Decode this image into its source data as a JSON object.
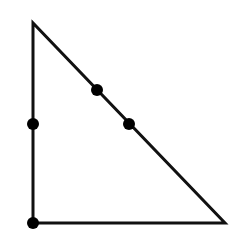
{
  "diagram": {
    "type": "right-triangle-with-points",
    "width": 229,
    "height": 246,
    "stroke_color": "#111111",
    "fill_color": "#ffffff",
    "point_color": "#000000",
    "stroke_width": 3,
    "point_radius": 6,
    "vertices": {
      "top": {
        "x": 33,
        "y": 23
      },
      "bottom_left": {
        "x": 33,
        "y": 223
      },
      "bottom_right": {
        "x": 225,
        "y": 223
      }
    },
    "points": [
      {
        "id": "left-side-midpoint",
        "x": 33,
        "y": 124
      },
      {
        "id": "hypotenuse-upper-point",
        "x": 97,
        "y": 90
      },
      {
        "id": "hypotenuse-lower-point",
        "x": 129,
        "y": 124
      },
      {
        "id": "right-angle-vertex-point",
        "x": 33,
        "y": 223
      }
    ]
  }
}
